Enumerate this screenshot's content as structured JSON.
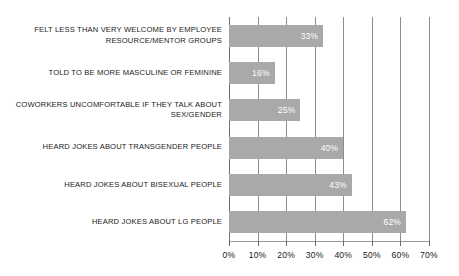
{
  "chart_data": {
    "type": "bar",
    "orientation": "horizontal",
    "title": "",
    "subtitle": "",
    "xlabel": "",
    "ylabel": "",
    "xlim": [
      0,
      70
    ],
    "grid": true,
    "legend": null,
    "categories": [
      "FELT LESS THAN VERY WELCOME BY EMPLOYEE\nRESOURCE/MENTOR GROUPS",
      "TOLD TO BE MORE MASCULINE OR FEMININE",
      "COWORKERS UNCOMFORTABLE IF THEY TALK ABOUT\nSEX/GENDER",
      "HEARD JOKES ABOUT TRANSGENDER PEOPLE",
      "HEARD JOKES ABOUT BISEXUAL PEOPLE",
      "HEARD JOKES ABOUT LG PEOPLE"
    ],
    "values": [
      33,
      16,
      25,
      40,
      43,
      62
    ],
    "value_labels": [
      "33%",
      "16%",
      "25%",
      "40%",
      "43%",
      "62%"
    ],
    "xticks": [
      0,
      10,
      20,
      30,
      40,
      50,
      60,
      70
    ],
    "xtick_labels": [
      "0%",
      "10%",
      "20%",
      "30%",
      "40%",
      "50%",
      "60%",
      "70%"
    ],
    "colors": {
      "bar": "#a9a9a9",
      "value_label": "#ffffff",
      "gridline": "#8d8d8d",
      "axis": "#6e6e6e",
      "text": "#1a1a1a",
      "background": "#ffffff"
    }
  }
}
